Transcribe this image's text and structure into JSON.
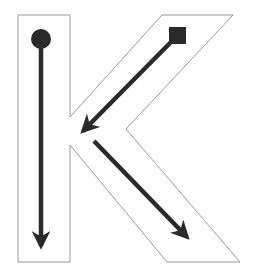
{
  "diagram": {
    "letter": "K",
    "colors": {
      "outline": "#9a9a9a",
      "stroke": "#2a2a2a",
      "background": "#ffffff"
    },
    "strokes": [
      {
        "order": 1,
        "start_marker": "circle",
        "direction": "down"
      },
      {
        "order": 2,
        "start_marker": "square",
        "direction": "down-left"
      },
      {
        "order": 3,
        "start_marker": "none",
        "direction": "down-right"
      }
    ]
  }
}
